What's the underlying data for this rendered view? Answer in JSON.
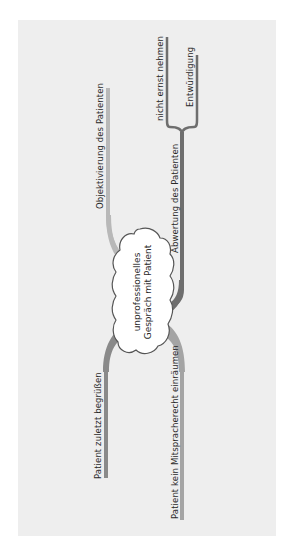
{
  "central_topic": {
    "line1": "unprofessionelles",
    "line2": "Gespräch mit Patient"
  },
  "branches": [
    {
      "id": "objektivierung",
      "label": "Objektivierung des Patienten",
      "color": "#b8b8b8"
    },
    {
      "id": "abwertung",
      "label": "Abwertung des Patienten",
      "color": "#6e6e6e",
      "children": [
        {
          "label": "nicht ernst nehmen"
        },
        {
          "label": "Entwürdigung"
        }
      ]
    },
    {
      "id": "zuletzt",
      "label": "Patient zuletzt begrüßen",
      "color": "#8a8a8a"
    },
    {
      "id": "mitsprache",
      "label": "Patient kein Mitspracherecht einräumen",
      "color": "#a4a4a4"
    }
  ],
  "colors": {
    "background": "#ffffff",
    "panel": "#eeeeee",
    "cloud_fill": "#ffffff",
    "cloud_stroke": "#555555",
    "text": "#2a2a2a"
  }
}
